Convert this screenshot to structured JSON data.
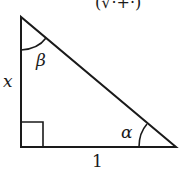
{
  "diagram": {
    "type": "right-triangle",
    "top_text_partial": "(√·+·)",
    "labels": {
      "side_vertical": "x",
      "side_horizontal": "1",
      "angle_top": "β",
      "angle_bottom_right": "α"
    },
    "vertices": {
      "top": [
        21,
        17
      ],
      "bottom_left": [
        21,
        147
      ],
      "bottom_right": [
        176,
        147
      ]
    },
    "right_angle_marker": true,
    "stroke_color": "#1a1a1a",
    "background": "#ffffff"
  }
}
